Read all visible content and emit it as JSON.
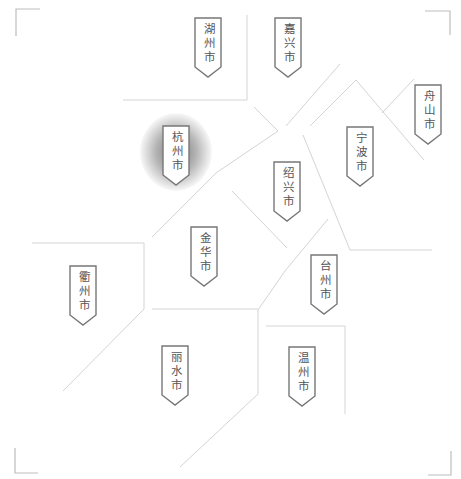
{
  "map": {
    "type": "region-map",
    "region": "浙江省",
    "highlighted_city": "杭州市",
    "colors": {
      "boundary": "#d4d4d4",
      "label_border": "#777777",
      "label_text": "#555555",
      "highlight_glow": "#5a5a5a",
      "background": "#ffffff"
    },
    "cities": [
      {
        "id": "huzhou",
        "name": "湖州市",
        "x": 194,
        "y": 17,
        "highlight": false
      },
      {
        "id": "jiaxing",
        "name": "嘉兴市",
        "x": 274,
        "y": 17,
        "highlight": false
      },
      {
        "id": "zhoushan",
        "name": "舟山市",
        "x": 414,
        "y": 84,
        "highlight": false
      },
      {
        "id": "hangzhou",
        "name": "杭州市",
        "x": 162,
        "y": 125,
        "highlight": true
      },
      {
        "id": "ningbo",
        "name": "宁波市",
        "x": 346,
        "y": 126,
        "highlight": false
      },
      {
        "id": "shaoxing",
        "name": "绍兴市",
        "x": 273,
        "y": 161,
        "highlight": false
      },
      {
        "id": "jinhua",
        "name": "金华市",
        "x": 190,
        "y": 226,
        "highlight": false
      },
      {
        "id": "quzhou",
        "name": "衢州市",
        "x": 69,
        "y": 265,
        "highlight": false
      },
      {
        "id": "taizhou",
        "name": "台州市",
        "x": 310,
        "y": 254,
        "highlight": false
      },
      {
        "id": "lishui",
        "name": "丽水市",
        "x": 161,
        "y": 345,
        "highlight": false
      },
      {
        "id": "wenzhou",
        "name": "温州市",
        "x": 288,
        "y": 346,
        "highlight": false
      }
    ]
  }
}
